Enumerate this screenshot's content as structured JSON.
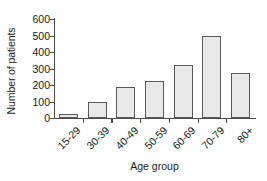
{
  "chart_data": {
    "type": "bar",
    "title": "",
    "xlabel": "Age group",
    "ylabel": "Number of patients",
    "categories": [
      "15-29",
      "30-39",
      "40-49",
      "50-59",
      "60-69",
      "70-79",
      "80+"
    ],
    "values": [
      22,
      97,
      190,
      225,
      320,
      495,
      270
    ],
    "ylim": [
      0,
      600
    ],
    "ytick_labels": [
      "0",
      "100",
      "200",
      "300",
      "400",
      "500",
      "600"
    ],
    "ytick_values": [
      0,
      100,
      200,
      300,
      400,
      500,
      600
    ],
    "grid": false,
    "legend": null,
    "bar_fill_color": "#e8e8e8",
    "bar_edge_color": "#595959",
    "axis_color": "#4d4d4d",
    "text_color": "#1a1a1a",
    "xtick_label_rotation": -45
  }
}
